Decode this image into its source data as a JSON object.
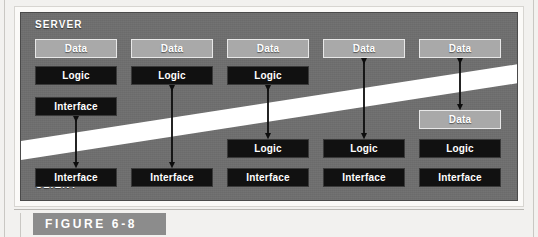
{
  "figure": {
    "caption": "FIGURE 6-8",
    "server_label": "SERVER",
    "client_label": "CLIENT",
    "colors": {
      "panel": "#6f6f6f",
      "data_box": "#a9a9a9",
      "logic_box": "#111111",
      "interface_box": "#111111",
      "divider": "#ffffff",
      "caption_bar": "#8c8c8c",
      "text": "#ffffff"
    },
    "labels": {
      "data": "Data",
      "logic": "Logic",
      "interface": "Interface"
    },
    "columns": [
      {
        "index": 1,
        "server_boxes": [
          "Data",
          "Logic",
          "Interface"
        ],
        "client_boxes": [
          "Interface"
        ],
        "arrow": "double"
      },
      {
        "index": 2,
        "server_boxes": [
          "Data",
          "Logic"
        ],
        "client_boxes": [
          "Interface"
        ],
        "arrow": "double"
      },
      {
        "index": 3,
        "server_boxes": [
          "Data",
          "Logic"
        ],
        "client_boxes": [
          "Logic",
          "Interface"
        ],
        "arrow": "double"
      },
      {
        "index": 4,
        "server_boxes": [
          "Data"
        ],
        "client_boxes": [
          "Logic",
          "Interface"
        ],
        "arrow": "double"
      },
      {
        "index": 5,
        "server_boxes": [
          "Data"
        ],
        "client_boxes": [
          "Data",
          "Logic",
          "Interface"
        ],
        "arrow": "double"
      }
    ]
  }
}
